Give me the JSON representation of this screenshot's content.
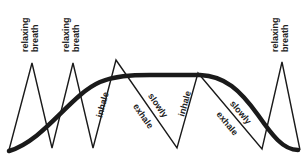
{
  "diagram": {
    "type": "breathing-pattern",
    "colors": {
      "background": "#ffffff",
      "line": "#1a1a1a",
      "curve": "#1a1a1a"
    },
    "labels": {
      "relaxing_breath_line1": "relaxing",
      "relaxing_breath_line2": "breath",
      "inhale": "inhale",
      "slowly": "slowly",
      "exhale": "exhale"
    },
    "breath_markers": [
      {
        "line1": "relaxing",
        "line2": "breath"
      },
      {
        "line1": "relaxing",
        "line2": "breath"
      },
      {
        "line1": "relaxing",
        "line2": "breath"
      }
    ],
    "phases": [
      {
        "label": "inhale"
      },
      {
        "label_top": "slowly",
        "label_bottom": "exhale"
      },
      {
        "label": "inhale"
      },
      {
        "label_top": "slowly",
        "label_bottom": "exhale"
      }
    ],
    "zigzag_points": [
      [
        9,
        150
      ],
      [
        32,
        63
      ],
      [
        52,
        148
      ],
      [
        73,
        63
      ],
      [
        93,
        148
      ],
      [
        116,
        60
      ],
      [
        177,
        148
      ],
      [
        198,
        73
      ],
      [
        262,
        149
      ],
      [
        282,
        62
      ],
      [
        300,
        150
      ]
    ],
    "curve_description": "thick S-shaped curve rising from left baseline to plateau then falling to right baseline"
  }
}
